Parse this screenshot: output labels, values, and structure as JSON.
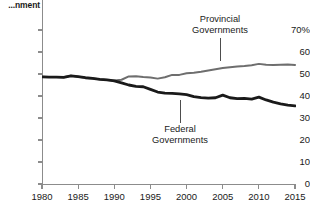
{
  "title": {
    "line1": "...ng by",
    "line2": "...nment"
  },
  "axes": {
    "y_ticks": [
      "70%",
      "60",
      "50",
      "40",
      "30",
      "20",
      "10",
      "0"
    ],
    "y_values": [
      70,
      60,
      50,
      40,
      30,
      20,
      10,
      0
    ],
    "x_ticks": [
      "1980",
      "1985",
      "1990",
      "1995",
      "2000",
      "2005",
      "2010",
      "2015"
    ],
    "x_values": [
      1980,
      1985,
      1990,
      1995,
      2000,
      2005,
      2010,
      2015
    ]
  },
  "annotations": {
    "provincial": {
      "line1": "Provincial",
      "line2": "Governments"
    },
    "federal": {
      "line1": "Federal",
      "line2": "Governments"
    }
  },
  "colors": {
    "provincial": "#6e6e6e",
    "federal": "#1a1a1a",
    "axis": "#8c8c8c",
    "text": "#1a1a1a",
    "background": "#ffffff"
  },
  "chart_data": {
    "type": "line",
    "title": "...ng by ...nment",
    "xlabel": "",
    "ylabel": "",
    "xlim": [
      1980,
      2015
    ],
    "ylim": [
      0,
      73
    ],
    "grid": false,
    "legend": "inline-annotations",
    "x": [
      1980,
      1981,
      1982,
      1983,
      1984,
      1985,
      1986,
      1987,
      1988,
      1989,
      1990,
      1991,
      1992,
      1993,
      1994,
      1995,
      1996,
      1997,
      1998,
      1999,
      2000,
      2001,
      2002,
      2003,
      2004,
      2005,
      2006,
      2007,
      2008,
      2009,
      2010,
      2011,
      2012,
      2013,
      2014,
      2015
    ],
    "series": [
      {
        "name": "Provincial Governments",
        "color": "#6e6e6e",
        "width": 2.0,
        "values": [
          48.7,
          48.6,
          48.6,
          48.5,
          49.2,
          48.8,
          48.3,
          48.0,
          47.6,
          47.3,
          47.0,
          47.4,
          48.9,
          49.0,
          48.6,
          48.4,
          47.9,
          48.5,
          49.6,
          49.6,
          50.3,
          50.6,
          51.0,
          51.6,
          52.2,
          52.7,
          53.1,
          53.4,
          53.6,
          54.0,
          54.6,
          54.2,
          54.1,
          54.2,
          54.3,
          54.1
        ]
      },
      {
        "name": "Federal Governments",
        "color": "#1a1a1a",
        "width": 2.8,
        "values": [
          48.7,
          48.6,
          48.6,
          48.5,
          49.1,
          48.8,
          48.3,
          48.0,
          47.6,
          47.3,
          46.9,
          46.0,
          45.0,
          44.4,
          44.2,
          43.0,
          41.8,
          41.3,
          41.2,
          41.0,
          40.6,
          39.7,
          39.3,
          39.0,
          39.2,
          40.4,
          39.2,
          38.8,
          38.9,
          38.6,
          39.5,
          38.2,
          37.2,
          36.4,
          35.9,
          35.5
        ]
      }
    ]
  }
}
